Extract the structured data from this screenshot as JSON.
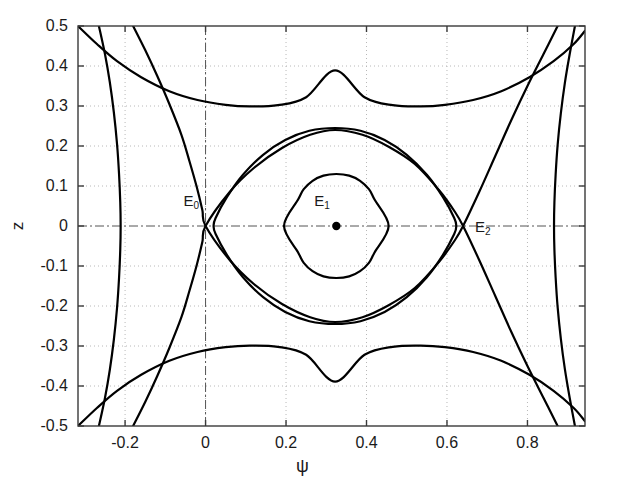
{
  "figure": {
    "background_color": "#ffffff",
    "curve_color": "#000000",
    "grid_color": "#b8b8b8",
    "axis_color": "#555555",
    "frame": {
      "left": 78,
      "top": 26,
      "right": 585,
      "bottom": 426
    }
  },
  "axes": {
    "x": {
      "label": "ψ",
      "min": -0.317,
      "max": 0.943,
      "ticks": [
        -0.2,
        0,
        0.2,
        0.4,
        0.6,
        0.8
      ],
      "tick_labels": [
        "-0.2",
        "0",
        "0.2",
        "0.4",
        "0.6",
        "0.8"
      ]
    },
    "y": {
      "label": "z",
      "min": -0.5,
      "max": 0.5,
      "ticks": [
        0.5,
        0.4,
        0.3,
        0.2,
        0.1,
        0,
        -0.1,
        -0.2,
        -0.3,
        -0.4,
        -0.5
      ],
      "tick_labels": [
        "0.5",
        "0.4",
        "0.3",
        "0.2",
        "0.1",
        "0",
        "-0.1",
        "-0.2",
        "-0.3",
        "-0.4",
        "-0.5"
      ]
    }
  },
  "annotations": [
    {
      "name": "E0",
      "base": "E",
      "sub": "0",
      "x": 0.0,
      "y": 0.0,
      "label_dx": -22,
      "label_dy": -34,
      "marker": false,
      "type": "saddle"
    },
    {
      "name": "E1",
      "base": "E",
      "sub": "1",
      "x": 0.325,
      "y": 0.0,
      "label_dx": -22,
      "label_dy": -34,
      "marker": true,
      "type": "center"
    },
    {
      "name": "E2",
      "base": "E",
      "sub": "2",
      "x": 0.64,
      "y": 0.0,
      "label_dx": 12,
      "label_dy": -8,
      "marker": false,
      "type": "saddle"
    }
  ],
  "chart_data": {
    "type": "line",
    "title": "",
    "xlabel": "ψ",
    "ylabel": "z",
    "xlim": [
      -0.317,
      0.943
    ],
    "ylim": [
      -0.5,
      0.5
    ],
    "grid": true,
    "legend": null,
    "equilibria": [
      {
        "name": "E0",
        "psi": 0.0,
        "z": 0.0,
        "kind": "saddle"
      },
      {
        "name": "E1",
        "psi": 0.325,
        "z": 0.0,
        "kind": "center"
      },
      {
        "name": "E2",
        "psi": 0.64,
        "z": 0.0,
        "kind": "saddle"
      }
    ],
    "series": [
      {
        "name": "inner-orbit-small",
        "closed": true,
        "points": [
          [
            0.325,
            0.13
          ],
          [
            0.357,
            0.126
          ],
          [
            0.384,
            0.113
          ],
          [
            0.406,
            0.092
          ],
          [
            0.42,
            0.066
          ],
          [
            0.455,
            0.0
          ],
          [
            0.42,
            -0.066
          ],
          [
            0.406,
            -0.092
          ],
          [
            0.384,
            -0.113
          ],
          [
            0.357,
            -0.126
          ],
          [
            0.325,
            -0.13
          ],
          [
            0.293,
            -0.126
          ],
          [
            0.266,
            -0.113
          ],
          [
            0.244,
            -0.092
          ],
          [
            0.23,
            -0.066
          ],
          [
            0.195,
            0.0
          ],
          [
            0.23,
            0.066
          ],
          [
            0.244,
            0.092
          ],
          [
            0.266,
            0.113
          ],
          [
            0.293,
            0.126
          ]
        ]
      },
      {
        "name": "inner-orbit-large",
        "closed": true,
        "points": [
          [
            0.322,
            0.245
          ],
          [
            0.385,
            0.238
          ],
          [
            0.445,
            0.215
          ],
          [
            0.5,
            0.178
          ],
          [
            0.55,
            0.128
          ],
          [
            0.59,
            0.072
          ],
          [
            0.618,
            0.02
          ],
          [
            0.623,
            0.0
          ],
          [
            0.618,
            -0.02
          ],
          [
            0.59,
            -0.072
          ],
          [
            0.55,
            -0.128
          ],
          [
            0.5,
            -0.178
          ],
          [
            0.445,
            -0.215
          ],
          [
            0.385,
            -0.238
          ],
          [
            0.322,
            -0.245
          ],
          [
            0.258,
            -0.238
          ],
          [
            0.198,
            -0.215
          ],
          [
            0.143,
            -0.178
          ],
          [
            0.093,
            -0.128
          ],
          [
            0.053,
            -0.072
          ],
          [
            0.025,
            -0.02
          ],
          [
            0.02,
            0.0
          ],
          [
            0.025,
            0.02
          ],
          [
            0.053,
            0.072
          ],
          [
            0.093,
            0.128
          ],
          [
            0.143,
            0.178
          ],
          [
            0.198,
            0.215
          ],
          [
            0.258,
            0.238
          ]
        ]
      },
      {
        "name": "separatrix-upper-arc",
        "closed": false,
        "points": [
          [
            -0.317,
            0.5
          ],
          [
            -0.27,
            0.455
          ],
          [
            -0.22,
            0.412
          ],
          [
            -0.16,
            0.372
          ],
          [
            -0.09,
            0.337
          ],
          [
            -0.02,
            0.315
          ],
          [
            0.05,
            0.303
          ],
          [
            0.11,
            0.299
          ],
          [
            0.18,
            0.302
          ],
          [
            0.25,
            0.322
          ],
          [
            0.322,
            0.389
          ],
          [
            0.395,
            0.322
          ],
          [
            0.465,
            0.302
          ],
          [
            0.535,
            0.299
          ],
          [
            0.595,
            0.303
          ],
          [
            0.665,
            0.315
          ],
          [
            0.735,
            0.337
          ],
          [
            0.805,
            0.372
          ],
          [
            0.865,
            0.412
          ],
          [
            0.915,
            0.455
          ],
          [
            0.943,
            0.488
          ]
        ]
      },
      {
        "name": "separatrix-lower-arc",
        "closed": false,
        "points": [
          [
            -0.317,
            -0.5
          ],
          [
            -0.27,
            -0.455
          ],
          [
            -0.22,
            -0.412
          ],
          [
            -0.16,
            -0.372
          ],
          [
            -0.09,
            -0.337
          ],
          [
            -0.02,
            -0.315
          ],
          [
            0.05,
            -0.303
          ],
          [
            0.11,
            -0.299
          ],
          [
            0.18,
            -0.302
          ],
          [
            0.25,
            -0.322
          ],
          [
            0.322,
            -0.389
          ],
          [
            0.395,
            -0.322
          ],
          [
            0.465,
            -0.302
          ],
          [
            0.535,
            -0.299
          ],
          [
            0.595,
            -0.303
          ],
          [
            0.665,
            -0.315
          ],
          [
            0.735,
            -0.337
          ],
          [
            0.805,
            -0.372
          ],
          [
            0.865,
            -0.412
          ],
          [
            0.915,
            -0.455
          ],
          [
            0.943,
            -0.488
          ]
        ]
      },
      {
        "name": "separatrix-through-saddles-upper",
        "closed": false,
        "points": [
          [
            -0.18,
            0.5
          ],
          [
            -0.15,
            0.44
          ],
          [
            -0.12,
            0.375
          ],
          [
            -0.09,
            0.305
          ],
          [
            -0.06,
            0.228
          ],
          [
            -0.04,
            0.162
          ],
          [
            -0.022,
            0.098
          ],
          [
            -0.008,
            0.04
          ],
          [
            0.0,
            0.0
          ],
          [
            0.06,
            -0.085
          ],
          [
            0.12,
            -0.145
          ],
          [
            0.19,
            -0.195
          ],
          [
            0.26,
            -0.228
          ],
          [
            0.322,
            -0.24
          ],
          [
            0.39,
            -0.228
          ],
          [
            0.455,
            -0.198
          ],
          [
            0.52,
            -0.155
          ],
          [
            0.58,
            -0.09
          ],
          [
            0.62,
            -0.035
          ],
          [
            0.64,
            0.0
          ],
          [
            0.68,
            0.085
          ],
          [
            0.72,
            0.175
          ],
          [
            0.76,
            0.265
          ],
          [
            0.8,
            0.35
          ],
          [
            0.84,
            0.43
          ],
          [
            0.875,
            0.5
          ]
        ]
      },
      {
        "name": "separatrix-through-saddles-lower",
        "closed": false,
        "points": [
          [
            -0.18,
            -0.5
          ],
          [
            -0.15,
            -0.44
          ],
          [
            -0.12,
            -0.375
          ],
          [
            -0.09,
            -0.305
          ],
          [
            -0.06,
            -0.228
          ],
          [
            -0.04,
            -0.162
          ],
          [
            -0.022,
            -0.098
          ],
          [
            -0.008,
            -0.04
          ],
          [
            0.0,
            0.0
          ],
          [
            0.06,
            0.085
          ],
          [
            0.12,
            0.145
          ],
          [
            0.19,
            0.195
          ],
          [
            0.26,
            0.228
          ],
          [
            0.322,
            0.24
          ],
          [
            0.39,
            0.228
          ],
          [
            0.455,
            0.198
          ],
          [
            0.52,
            0.155
          ],
          [
            0.58,
            0.09
          ],
          [
            0.62,
            0.035
          ],
          [
            0.64,
            0.0
          ],
          [
            0.68,
            -0.085
          ],
          [
            0.72,
            -0.175
          ],
          [
            0.76,
            -0.265
          ],
          [
            0.8,
            -0.35
          ],
          [
            0.84,
            -0.43
          ],
          [
            0.875,
            -0.5
          ]
        ]
      },
      {
        "name": "outer-left-branch",
        "closed": false,
        "points": [
          [
            -0.265,
            0.5
          ],
          [
            -0.25,
            0.43
          ],
          [
            -0.238,
            0.36
          ],
          [
            -0.228,
            0.285
          ],
          [
            -0.22,
            0.205
          ],
          [
            -0.215,
            0.13
          ],
          [
            -0.212,
            0.06
          ],
          [
            -0.211,
            0.0
          ],
          [
            -0.212,
            -0.06
          ],
          [
            -0.215,
            -0.13
          ],
          [
            -0.22,
            -0.205
          ],
          [
            -0.228,
            -0.285
          ],
          [
            -0.238,
            -0.36
          ],
          [
            -0.25,
            -0.43
          ],
          [
            -0.265,
            -0.5
          ]
        ]
      },
      {
        "name": "outer-right-branch",
        "closed": false,
        "points": [
          [
            0.918,
            0.5
          ],
          [
            0.905,
            0.43
          ],
          [
            0.893,
            0.358
          ],
          [
            0.883,
            0.282
          ],
          [
            0.875,
            0.203
          ],
          [
            0.87,
            0.128
          ],
          [
            0.867,
            0.06
          ],
          [
            0.866,
            0.0
          ],
          [
            0.867,
            -0.06
          ],
          [
            0.87,
            -0.128
          ],
          [
            0.875,
            -0.203
          ],
          [
            0.883,
            -0.282
          ],
          [
            0.893,
            -0.358
          ],
          [
            0.905,
            -0.43
          ],
          [
            0.918,
            -0.5
          ]
        ]
      }
    ]
  }
}
